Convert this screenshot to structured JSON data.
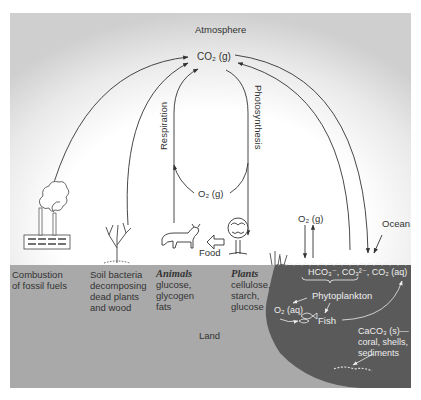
{
  "diagram": {
    "type": "carbon-cycle",
    "colors": {
      "land": "#a9a9a9",
      "ocean": "#5a5a5a",
      "sky_center": "#ffffff",
      "sky_edge": "#cfcfcf",
      "arrow": "#333333",
      "ocean_text": "#eeeeee"
    },
    "atmosphere": {
      "label": "Atmosphere",
      "co2": "CO₂ (g)"
    },
    "cycle": {
      "respiration": "Respiration",
      "photosynthesis": "Photosynthesis",
      "o2_gas": "O₂ (g)"
    },
    "land_sources": {
      "combustion": [
        "Combustion",
        "of fossil fuels"
      ],
      "soil": [
        "Soil bacteria",
        "decomposing",
        "dead plants",
        "and wood"
      ],
      "animals": {
        "title": "Animals",
        "lines": [
          "glucose,",
          "glycogen",
          "fats"
        ]
      },
      "plants": {
        "title": "Plants",
        "lines": [
          "cellulose,",
          "starch,",
          "glucose"
        ]
      },
      "food": "Food"
    },
    "ocean": {
      "label": "Ocean",
      "o2_exchange": "O₂ (g)",
      "dissolved": "HCO₃⁻, CO₃²⁻, CO₂ (aq)",
      "phytoplankton": "Phytoplankton",
      "o2_aq": "O₂ (aq)",
      "fish": "Fish",
      "caco3": [
        "CaCO₃ (s)—",
        "coral, shells,",
        "sediments"
      ]
    },
    "land_label": "Land"
  }
}
